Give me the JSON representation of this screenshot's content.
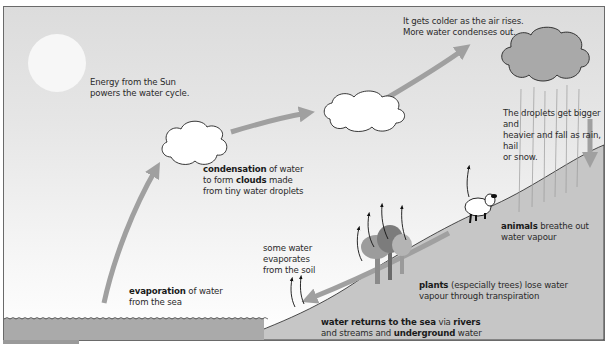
{
  "diagram": {
    "title": "The water cycle",
    "colors": {
      "sky_top": "#dcdcdc",
      "sky_bottom": "#ffffff",
      "land": "#c4c4c4",
      "sea": "#a8a8a8",
      "arrow": "#a0a0a0",
      "dark_cloud": "#a9a9a9",
      "text": "#2a2a2a"
    },
    "labels": {
      "sun": {
        "line1": "Energy from the Sun",
        "line2": "powers the water cycle."
      },
      "colder": {
        "line1": "It gets colder as the air rises.",
        "line2": "More water condenses out."
      },
      "condensation": {
        "bold1": "condensation",
        "rest1": " of water",
        "pre2": "to form ",
        "bold2": "clouds",
        "rest2": " made",
        "line3": "from tiny water droplets"
      },
      "droplets": {
        "line1": "The droplets get bigger and",
        "line2": "heavier and fall as rain, hail",
        "line3": "or snow."
      },
      "animals": {
        "bold": "animals",
        "rest": " breathe out",
        "line2": "water vapour"
      },
      "soil": {
        "line1": "some water",
        "line2": "evaporates",
        "line3": "from the soil"
      },
      "plants": {
        "bold": "plants",
        "rest": " (especially trees) lose water",
        "line2": "vapour through transpiration"
      },
      "evaporation": {
        "bold": "evaporation",
        "rest": " of water",
        "line2": "from the sea"
      },
      "returns": {
        "bold1": "water returns to the sea",
        "mid1": " via ",
        "bold2": "rivers",
        "pre2": "and streams and  ",
        "bold3": "underground",
        "rest2": " water"
      }
    },
    "elements": [
      "sun",
      "small-cloud",
      "medium-cloud",
      "rain-cloud",
      "rain",
      "sheep",
      "trees",
      "sea",
      "hillside"
    ]
  }
}
